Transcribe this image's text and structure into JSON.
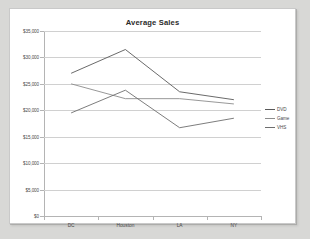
{
  "chart_data": {
    "type": "line",
    "title": "Average Sales",
    "xlabel": "",
    "ylabel": "",
    "categories": [
      "DC",
      "Houston",
      "LA",
      "NY"
    ],
    "series": [
      {
        "name": "DVD",
        "values": [
          27000,
          31500,
          23500,
          22000
        ],
        "color": "#595959"
      },
      {
        "name": "Game",
        "values": [
          25000,
          22200,
          22200,
          21200
        ],
        "color": "#8c8c8c"
      },
      {
        "name": "VHS",
        "values": [
          19500,
          23800,
          16700,
          18500
        ],
        "color": "#6e6e6e"
      }
    ],
    "ylim": [
      0,
      35000
    ],
    "ytick_values": [
      35000,
      30000,
      25000,
      20000,
      15000,
      10000,
      5000,
      0
    ],
    "ytick_labels": [
      "$35,000",
      "$30,000",
      "$25,000",
      "$20,000",
      "$15,000",
      "$10,000",
      "$5,000",
      "$0"
    ],
    "grid": true,
    "legend_position": "right"
  },
  "legend": {
    "items": [
      {
        "label": "DVD"
      },
      {
        "label": "Game"
      },
      {
        "label": "VHS"
      }
    ]
  },
  "colors": {
    "background": "#d8d8d6",
    "plot_background": "#ffffff",
    "gridline": "#d0d0d0",
    "axis": "#b4b4b4",
    "text": "#4a4a4a",
    "title": "#2b2b2b"
  }
}
